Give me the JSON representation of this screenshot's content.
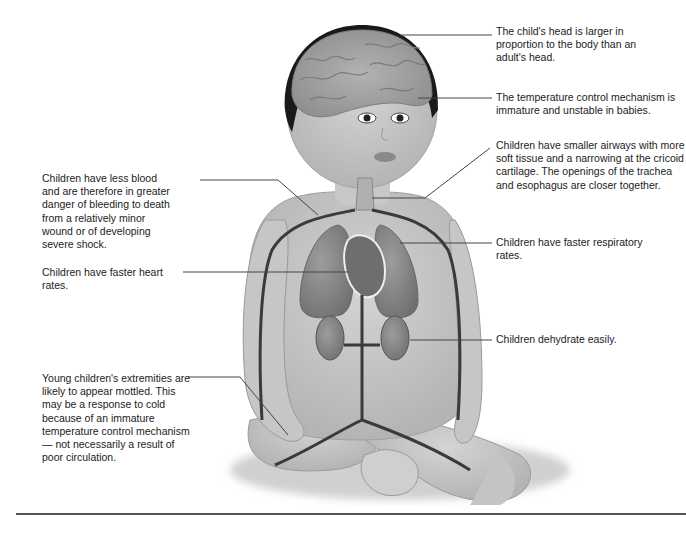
{
  "diagram": {
    "annotations": {
      "head": "The child's head is larger in proportion to the body than an adult's head.",
      "temperature": "The temperature control mechanism is immature and unstable in babies.",
      "airways": "Children have smaller airways with more soft tissue and a narrowing at the cricoid cartilage. The openings of the trachea and esophagus are closer together.",
      "blood": "Children have less blood and are therefore in greater danger of bleeding to death from a relatively minor wound or of developing severe shock.",
      "heart": "Children have faster heart rates.",
      "respiratory": "Children have faster respiratory rates.",
      "dehydrate": "Children dehydrate easily.",
      "extremities": "Young children's extremities are likely to appear mottled. This may be a response to cold because of an immature temperature control mechanism — not necessarily a result of poor circulation."
    },
    "colors": {
      "skin": "#c8c8c8",
      "skin_shadow": "#a9a9a9",
      "hair": "#1a1a1a",
      "brain": "#a3a3a3",
      "organ": "#8a8a8a",
      "vessel": "#3a3a3a",
      "leader_line": "#444444"
    }
  }
}
